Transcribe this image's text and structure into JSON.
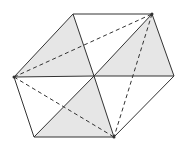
{
  "diagram": {
    "type": "hexagon-dissection",
    "width": 183,
    "height": 146,
    "colors": {
      "stroke": "#333333",
      "shade": "#e6e6e6",
      "background": "#ffffff"
    },
    "vertices": {
      "A": [
        73,
        14
      ],
      "B": [
        152,
        14
      ],
      "C": [
        174,
        76
      ],
      "D": [
        114,
        137
      ],
      "E": [
        34,
        137
      ],
      "F": [
        14,
        77
      ],
      "O": [
        94,
        76
      ]
    },
    "shaded_triangles": [
      [
        "F",
        "A",
        "O"
      ],
      [
        "B",
        "C",
        "O"
      ],
      [
        "O",
        "D",
        "E"
      ]
    ],
    "solid_edges": [
      [
        "A",
        "B"
      ],
      [
        "B",
        "C"
      ],
      [
        "C",
        "D"
      ],
      [
        "D",
        "E"
      ],
      [
        "E",
        "F"
      ],
      [
        "F",
        "A"
      ],
      [
        "A",
        "O"
      ],
      [
        "O",
        "D"
      ],
      [
        "B",
        "O"
      ],
      [
        "O",
        "E"
      ],
      [
        "F",
        "O"
      ],
      [
        "O",
        "C"
      ]
    ],
    "dashed_edges": [
      [
        "F",
        "B"
      ],
      [
        "F",
        "D"
      ],
      [
        "B",
        "D"
      ]
    ],
    "marked_points": [
      "F",
      "B",
      "D"
    ]
  }
}
